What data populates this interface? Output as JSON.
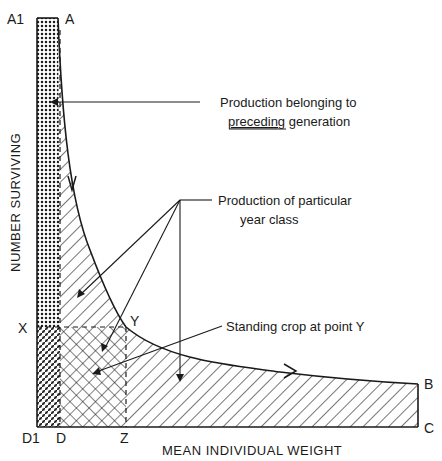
{
  "figure": {
    "type": "production diagram (Allen curve)",
    "axes": {
      "y_label": "NUMBER SURVIVING",
      "x_label": "MEAN INDIVIDUAL WEIGHT"
    },
    "points": {
      "A1": "A1",
      "A": "A",
      "X": "X",
      "Y": "Y",
      "D1": "D1",
      "D": "D",
      "Z": "Z",
      "B": "B",
      "C": "C"
    },
    "annotations": {
      "preceding_line1": "Production belonging to",
      "preceding_word": "preceding",
      "preceding_rest": " generation",
      "year_class_line1": "Production of particular",
      "year_class_line2": "year class",
      "standing_crop": "Standing crop at point  Y"
    },
    "legend_patterns": {
      "dotted": "production belonging to preceding generation",
      "hatched": "production of particular year class",
      "cross_hatched": "standing crop at point Y"
    },
    "colors": {
      "ink": "#1a1a1a",
      "background": "#ffffff"
    }
  }
}
